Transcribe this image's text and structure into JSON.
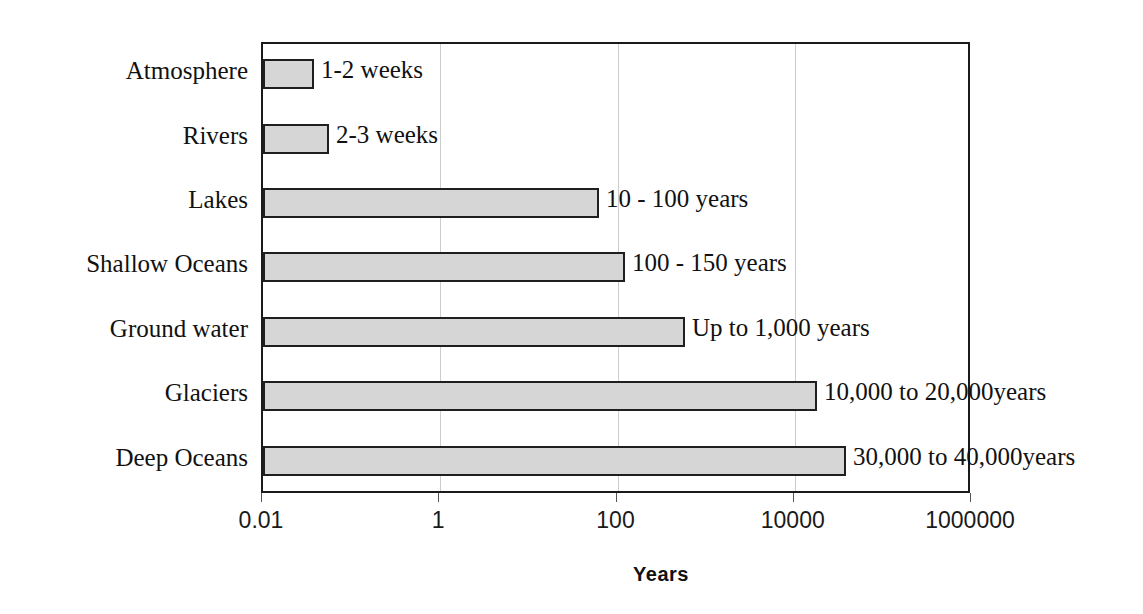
{
  "chart_data": {
    "type": "bar",
    "orientation": "horizontal",
    "title": "",
    "xlabel": "Years",
    "ylabel": "",
    "xscale": "log",
    "xlim": [
      0.01,
      1000000
    ],
    "xticks": [
      "0.01",
      "1",
      "100",
      "10000",
      "1000000"
    ],
    "xtick_values": [
      0.01,
      1,
      100,
      10000,
      1000000
    ],
    "grid": true,
    "grid_axis": "x",
    "legend": "none",
    "bar_fill_color": "#d6d6d6",
    "bar_edge_color": "#1f1f1f",
    "categories": [
      "Atmosphere",
      "Rivers",
      "Lakes",
      "Shallow Oceans",
      "Ground water",
      "Glaciers",
      "Deep Oceans"
    ],
    "values": [
      0.027,
      0.046,
      50,
      125,
      1000,
      15000,
      35000
    ],
    "data_labels": [
      "1-2 weeks",
      "2-3 weeks",
      "10 - 100 years",
      "100 - 150 years",
      "Up to 1,000 years",
      "10,000 to 20,000years",
      "30,000 to 40,000years"
    ],
    "bars": [
      {
        "category": "Atmosphere",
        "label": "1-2 weeks",
        "value": 0.027,
        "bar_end_px": 312
      },
      {
        "category": "Rivers",
        "label": "2-3 weeks",
        "value": 0.046,
        "bar_end_px": 327
      },
      {
        "category": "Lakes",
        "label": "10 - 100 years",
        "value": 50,
        "bar_end_px": 597
      },
      {
        "category": "Shallow Oceans",
        "label": "100 - 150 years",
        "value": 125,
        "bar_end_px": 623
      },
      {
        "category": "Ground water",
        "label": "Up to 1,000 years",
        "value": 1000,
        "bar_end_px": 683
      },
      {
        "category": "Glaciers",
        "label": "10,000 to 20,000years",
        "value": 15000,
        "bar_end_px": 815
      },
      {
        "category": "Deep Oceans",
        "label": "30,000 to 40,000years",
        "value": 35000,
        "bar_end_px": 844
      }
    ]
  },
  "layout": {
    "plot_left_px": 261,
    "plot_top_px": 42,
    "plot_width_px": 709,
    "plot_height_px": 451,
    "band_height_px": 64.4,
    "bar_height_px": 30
  }
}
